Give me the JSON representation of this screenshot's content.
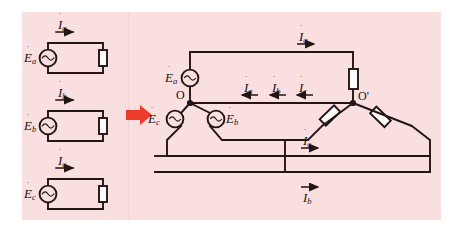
{
  "figure": {
    "background_color": "#fadfe0",
    "line_color": "#231513",
    "arrow_color": "#ef3b2c",
    "panels": [
      "left-panel",
      "right-panel"
    ]
  },
  "left_circuits": [
    {
      "source_label": "E",
      "source_sub": "a",
      "current_label": "I",
      "current_sub": "a",
      "current_direction": "right"
    },
    {
      "source_label": "E",
      "source_sub": "b",
      "current_label": "I",
      "current_sub": "b",
      "current_direction": "right"
    },
    {
      "source_label": "E",
      "source_sub": "c",
      "current_label": "I",
      "current_sub": "c",
      "current_direction": "right"
    }
  ],
  "transform_arrow": {
    "name": "red-right-arrow",
    "direction": "right",
    "color": "#ef3b2c"
  },
  "right_circuit": {
    "source_node": "O",
    "load_node": "O'",
    "sources": [
      {
        "label": "E",
        "sub": "a",
        "position": "top"
      },
      {
        "label": "E",
        "sub": "c",
        "position": "lower-left"
      },
      {
        "label": "E",
        "sub": "b",
        "position": "lower-right"
      }
    ],
    "resistors": [
      {
        "name": "resistor-a",
        "position": "top-vertical"
      },
      {
        "name": "resistor-c",
        "position": "lower-left-diagonal"
      },
      {
        "name": "resistor-b",
        "position": "lower-right-diagonal"
      }
    ],
    "currents": [
      {
        "label": "I",
        "sub": "a",
        "direction": "right",
        "position": "top-line"
      },
      {
        "label": "I",
        "sub": "a",
        "direction": "left",
        "position": "middle-line-1"
      },
      {
        "label": "I",
        "sub": "b",
        "direction": "left",
        "position": "middle-line-2"
      },
      {
        "label": "I",
        "sub": "c",
        "direction": "left",
        "position": "middle-line-3"
      },
      {
        "label": "I",
        "sub": "c",
        "direction": "right",
        "position": "lower-line"
      },
      {
        "label": "I",
        "sub": "b",
        "direction": "right",
        "position": "bottom-line"
      }
    ]
  }
}
